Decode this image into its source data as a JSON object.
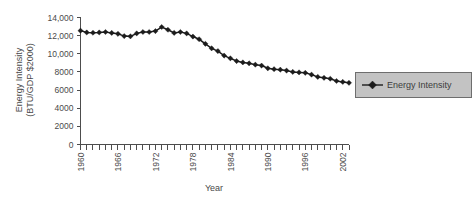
{
  "chart_data": {
    "type": "line",
    "title": "",
    "xlabel": "Year",
    "ylabel": "Energy Intensity (BTU/GDP $2000)",
    "ylabel_line1": "Energy Intensity",
    "ylabel_line2": "(BTU/GDP $2000)",
    "xlim": [
      1960,
      2003
    ],
    "ylim": [
      0,
      14000
    ],
    "grid": false,
    "legend_position": "right",
    "ytick_values": [
      0,
      2000,
      4000,
      6000,
      8000,
      10000,
      12000,
      14000
    ],
    "ytick_labels": [
      "0",
      "2000",
      "4000",
      "6000",
      "8000",
      "10,000",
      "12,000",
      "14,000"
    ],
    "xtick_values": [
      1960,
      1966,
      1972,
      1978,
      1984,
      1990,
      1996,
      2002
    ],
    "xtick_labels": [
      "1960",
      "1966",
      "1972",
      "1978",
      "1984",
      "1990",
      "1996",
      "2002"
    ],
    "xtick_minor_step": 1,
    "series": [
      {
        "name": "Energy Intensity",
        "color": "#1c1c1c",
        "marker": "diamond",
        "x": [
          1960,
          1961,
          1962,
          1963,
          1964,
          1965,
          1966,
          1967,
          1968,
          1969,
          1970,
          1971,
          1972,
          1973,
          1974,
          1975,
          1976,
          1977,
          1978,
          1979,
          1980,
          1981,
          1982,
          1983,
          1984,
          1985,
          1986,
          1987,
          1988,
          1989,
          1990,
          1991,
          1992,
          1993,
          1994,
          1995,
          1996,
          1997,
          1998,
          1999,
          2000,
          2001,
          2002,
          2003
        ],
        "values": [
          12550,
          12350,
          12320,
          12350,
          12400,
          12300,
          12200,
          11950,
          11920,
          12250,
          12400,
          12400,
          12500,
          12950,
          12650,
          12300,
          12400,
          12250,
          11900,
          11600,
          11100,
          10600,
          10300,
          9800,
          9500,
          9200,
          9050,
          8950,
          8800,
          8700,
          8400,
          8300,
          8250,
          8150,
          8000,
          7950,
          7900,
          7700,
          7450,
          7350,
          7250,
          7000,
          6900,
          6800
        ]
      }
    ]
  },
  "legend": {
    "entries": [
      {
        "label": "Energy Intensity"
      }
    ]
  },
  "axes": {
    "x_title": "Year",
    "y_title_line1": "Energy Intensity",
    "y_title_line2": "(BTU/GDP $2000)"
  }
}
